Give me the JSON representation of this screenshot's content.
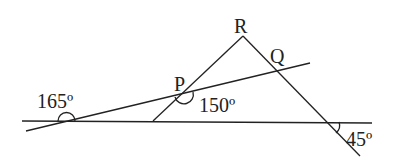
{
  "diagram": {
    "points": {
      "P": "P",
      "Q": "Q",
      "R": "R"
    },
    "angles": {
      "left_exterior": "165º",
      "at_P": "150º",
      "bottom_right": "45º"
    },
    "stroke_color": "#222222"
  }
}
